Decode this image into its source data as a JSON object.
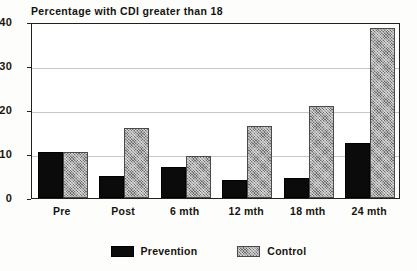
{
  "chart_data": {
    "type": "bar",
    "title": "Percentage with CDI greater than 18",
    "xlabel": "",
    "ylabel": "",
    "ylim": [
      0,
      40
    ],
    "yticks": [
      0,
      10,
      20,
      30,
      40
    ],
    "grid": true,
    "grid_axis": "y",
    "legend_position": "bottom-center",
    "categories": [
      "Pre",
      "Post",
      "6 mth",
      "12 mth",
      "18 mth",
      "24 mth"
    ],
    "series": [
      {
        "name": "Prevention",
        "color": "#0b0b0b",
        "fill": "solid-black",
        "values": [
          10.5,
          5.0,
          7.0,
          4.0,
          4.5,
          12.5
        ]
      },
      {
        "name": "Control",
        "color": "#a6a6a6",
        "fill": "gray-crosshatch",
        "values": [
          10.5,
          16.0,
          9.5,
          16.3,
          20.8,
          38.7
        ]
      }
    ]
  },
  "legend": {
    "entries": [
      {
        "label": "Prevention",
        "swatch": "solid-black-swatch"
      },
      {
        "label": "Control",
        "swatch": "gray-crosshatch-swatch"
      }
    ]
  }
}
